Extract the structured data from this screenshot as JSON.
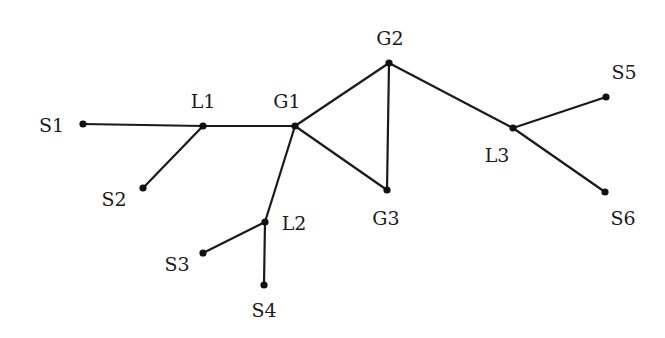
{
  "diagram": {
    "type": "network-graph",
    "nodes": [
      {
        "id": "S1",
        "label": "S1",
        "x": 83,
        "y": 124,
        "lx": 64,
        "ly": 132,
        "anchor": "end"
      },
      {
        "id": "L1",
        "label": "L1",
        "x": 203,
        "y": 126,
        "lx": 203,
        "ly": 108,
        "anchor": "middle"
      },
      {
        "id": "G1",
        "label": "G1",
        "x": 295,
        "y": 126,
        "lx": 287,
        "ly": 108,
        "anchor": "middle"
      },
      {
        "id": "S2",
        "label": "S2",
        "x": 143,
        "y": 188,
        "lx": 114,
        "ly": 206,
        "anchor": "middle"
      },
      {
        "id": "L2",
        "label": "L2",
        "x": 265,
        "y": 222,
        "lx": 294,
        "ly": 230,
        "anchor": "middle"
      },
      {
        "id": "S3",
        "label": "S3",
        "x": 203,
        "y": 253,
        "lx": 177,
        "ly": 271,
        "anchor": "middle"
      },
      {
        "id": "S4",
        "label": "S4",
        "x": 264,
        "y": 285,
        "lx": 264,
        "ly": 317,
        "anchor": "middle"
      },
      {
        "id": "G2",
        "label": "G2",
        "x": 389,
        "y": 63,
        "lx": 390,
        "ly": 45,
        "anchor": "middle"
      },
      {
        "id": "G3",
        "label": "G3",
        "x": 387,
        "y": 190,
        "lx": 386,
        "ly": 225,
        "anchor": "middle"
      },
      {
        "id": "L3",
        "label": "L3",
        "x": 513,
        "y": 128,
        "lx": 497,
        "ly": 162,
        "anchor": "middle"
      },
      {
        "id": "S5",
        "label": "S5",
        "x": 606,
        "y": 97,
        "lx": 624,
        "ly": 79,
        "anchor": "middle"
      },
      {
        "id": "S6",
        "label": "S6",
        "x": 605,
        "y": 192,
        "lx": 623,
        "ly": 225,
        "anchor": "middle"
      }
    ],
    "edges": [
      [
        "S1",
        "L1"
      ],
      [
        "L1",
        "G1"
      ],
      [
        "L1",
        "S2"
      ],
      [
        "G1",
        "L2"
      ],
      [
        "L2",
        "S3"
      ],
      [
        "L2",
        "S4"
      ],
      [
        "G1",
        "G2"
      ],
      [
        "G1",
        "G3"
      ],
      [
        "G2",
        "G3"
      ],
      [
        "G2",
        "L3"
      ],
      [
        "L3",
        "S5"
      ],
      [
        "L3",
        "S6"
      ]
    ]
  }
}
